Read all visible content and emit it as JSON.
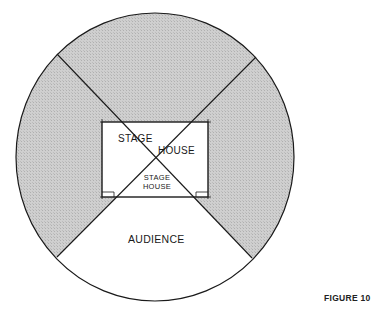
{
  "figure": {
    "label": "FIGURE 10"
  },
  "diagram": {
    "type": "theatre-in-the-round plan",
    "regions": {
      "stage_house_upper_left": "STAGE",
      "stage_house_upper_right": "HOUSE",
      "stage_house_center_line1": "STAGE",
      "stage_house_center_line2": "HOUSE",
      "audience": "AUDIENCE"
    },
    "colors": {
      "shaded_seating": "#c6c6c6",
      "outline": "#1a1a1a",
      "background": "#ffffff"
    }
  }
}
